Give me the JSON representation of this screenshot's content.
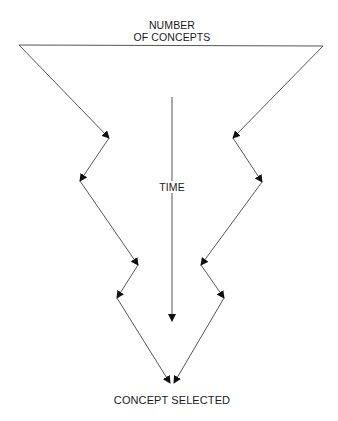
{
  "diagram": {
    "type": "funnel",
    "title_lines": [
      "NUMBER",
      "OF CONCEPTS"
    ],
    "axis_label": "TIME",
    "outcome_label": "CONCEPT SELECTED",
    "line_color": "#555555",
    "arrow_color": "#111111",
    "nodes": {
      "top_left": [
        19,
        45
      ],
      "top_right": [
        323,
        46
      ],
      "left": [
        [
          109,
          138
        ],
        [
          80,
          181
        ],
        [
          138,
          265
        ],
        [
          117,
          298
        ]
      ],
      "right": [
        [
          233,
          138
        ],
        [
          262,
          182
        ],
        [
          201,
          265
        ],
        [
          224,
          298
        ]
      ],
      "bottom": [
        170,
        383
      ]
    },
    "time_arrow": {
      "x": 172,
      "y_start": 97,
      "y_end": 321
    }
  }
}
